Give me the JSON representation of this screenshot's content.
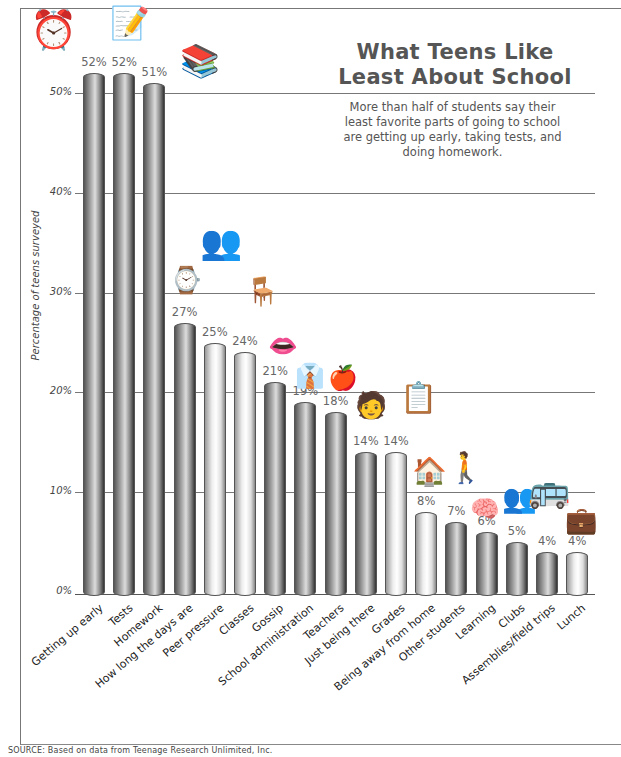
{
  "chart_data": {
    "type": "bar",
    "title": "What Teens Like Least About School",
    "subtitle": "More than half of students say their least favorite parts of going to school are getting up early, taking tests, and doing homework.",
    "xlabel": "",
    "ylabel": "Percentage of teens surveyed",
    "ylim": [
      0,
      55
    ],
    "yticks": [
      "0%",
      "10%",
      "20%",
      "30%",
      "40%",
      "50%"
    ],
    "grid": true,
    "categories": [
      "Getting up early",
      "Tests",
      "Homework",
      "How long the days are",
      "Peer pressure",
      "Classes",
      "Gossip",
      "School administration",
      "Teachers",
      "Just being there",
      "Grades",
      "Being away from home",
      "Other students",
      "Learning",
      "Clubs",
      "Assemblies/field trips",
      "Lunch"
    ],
    "values": [
      52,
      52,
      51,
      27,
      25,
      24,
      21,
      19,
      18,
      14,
      14,
      8,
      7,
      6,
      5,
      4,
      4
    ],
    "labels": [
      "52%",
      "52%",
      "51%",
      "27%",
      "25%",
      "24%",
      "21%",
      "19%",
      "18%",
      "14%",
      "14%",
      "8%",
      "7%",
      "6%",
      "5%",
      "4%",
      "4%"
    ],
    "shades": [
      "dark",
      "dark",
      "dark",
      "dark",
      "light",
      "light",
      "dark",
      "dark",
      "dark",
      "dark",
      "light",
      "light",
      "dark",
      "dark",
      "dark",
      "dark",
      "light"
    ],
    "source": "SOURCE: Based on data from Teenage Research Unlimited, Inc."
  },
  "icons": [
    "alarm-clock-icon",
    "paper-pencil-icon",
    "books-icon",
    "wristwatch-icon",
    "people-icon",
    "student-desk-icon",
    "talking-mouth-icon",
    "suit-icon",
    "apple-icon",
    "student-sitting-icon",
    "report-card-icon",
    "house-icon",
    "students-walking-icon",
    "brain-icon",
    "people-group-icon",
    "school-bus-icon",
    "briefcase-icon"
  ]
}
